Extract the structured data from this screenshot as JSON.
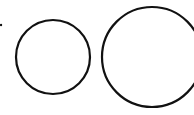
{
  "diagram": {
    "background": "#ffffff",
    "stroke_color": "#111111",
    "dot": {
      "cx": 1,
      "cy": 25,
      "r": 1.2
    },
    "circles": [
      {
        "label": "small-circle",
        "cx": 53,
        "cy": 57,
        "r": 37,
        "stroke_width": 2.2
      },
      {
        "label": "large-circle",
        "cx": 152,
        "cy": 57,
        "r": 50,
        "stroke_width": 2.2
      }
    ]
  }
}
